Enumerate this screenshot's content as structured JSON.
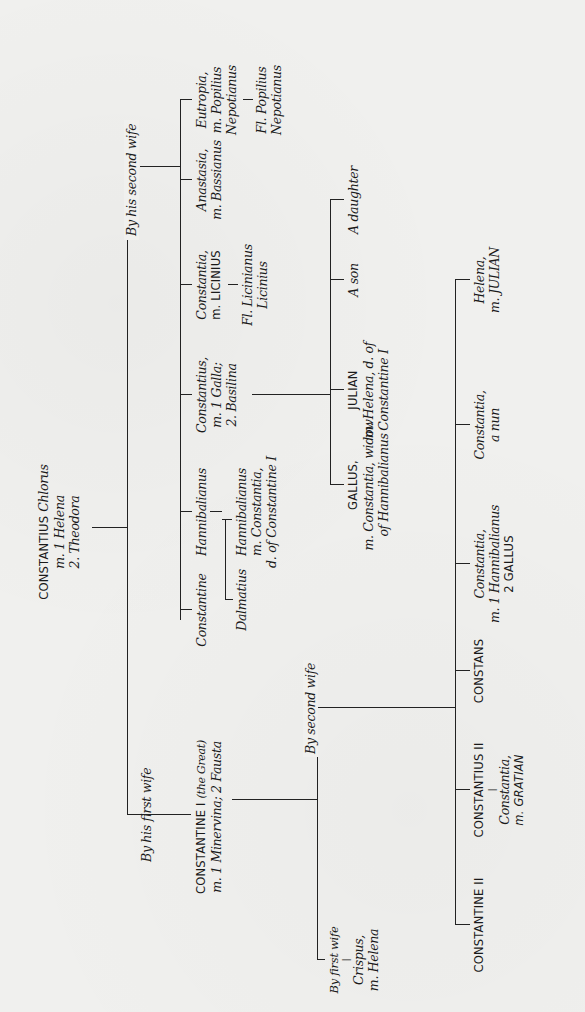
{
  "orientation": "rotated 90 degrees counter-clockwise",
  "root": {
    "name": "CONSTANTIUS",
    "name_suffix": "Chlorus",
    "line2": "m. 1 Helena",
    "line3": "2. Theodora"
  },
  "branches": {
    "first_wife_label": "By his first wife",
    "second_wife_label": "By his second wife"
  },
  "constantine_i": {
    "name": "CONSTANTINE I",
    "epithet": "(the Great)",
    "line2": "m. 1 Minervina; 2 Fausta",
    "by_first_wife_label": "By first wife",
    "by_second_wife_label": "By second wife",
    "crispus": {
      "name": "Crispus,",
      "line2": "m. Helena"
    },
    "children_second_wife": [
      {
        "name": "CONSTANTINE II",
        "line2": ""
      },
      {
        "name": "CONSTANTIUS II",
        "child": {
          "name": "Constantia,",
          "line2": "m. GRATIAN"
        }
      },
      {
        "name": "CONSTANS",
        "line2": ""
      },
      {
        "name": "Constantia,",
        "line2": "m. 1 Hannibalianus",
        "line3": "2 GALLUS"
      },
      {
        "name": "Constantia,",
        "line2": "a nun"
      },
      {
        "name": "Helena,",
        "line2": "m. JULIAN"
      }
    ]
  },
  "second_wife_children": [
    {
      "name": "Constantine",
      "children": [
        {
          "name": "Dalmatius"
        }
      ]
    },
    {
      "name": "Hannibalianus",
      "children": [
        {
          "name": "Hannibalianus",
          "line2": "m. Constantia,",
          "line3": "d. of Constantine I"
        }
      ]
    },
    {
      "name": "Constantius,",
      "line2": "m. 1 Galla;",
      "line3": "2. Basilina",
      "children": [
        {
          "name": "GALLUS,",
          "line2": "m. Constantia, widow",
          "line3": "of Hannibalianus"
        },
        {
          "name": "JULIAN",
          "line2": "m. Helena, d. of",
          "line3": "Constantine I"
        },
        {
          "name": "A son"
        },
        {
          "name": "A daughter"
        }
      ]
    },
    {
      "name": "Constantia,",
      "line2": "m. LICINIUS",
      "child": {
        "name": "Fl. Licinianus",
        "line2": "Licinius"
      }
    },
    {
      "name": "Anastasia,",
      "line2": "m. Bassianus"
    },
    {
      "name": "Eutropia,",
      "line2": "m. Popilius",
      "line3": "Nepotianus",
      "child": {
        "name": "Fl. Popilius",
        "line2": "Nepotianus"
      }
    }
  ]
}
